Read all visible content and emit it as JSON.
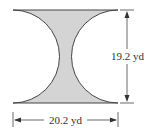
{
  "figure": {
    "shape": "rectangle with two semicircular cutouts on left and right sides",
    "fill_color": "#d4d4d4",
    "stroke_color": "#444444",
    "dimensions": {
      "height_label": "19.2 yd",
      "width_label": "20.2 yd"
    }
  }
}
